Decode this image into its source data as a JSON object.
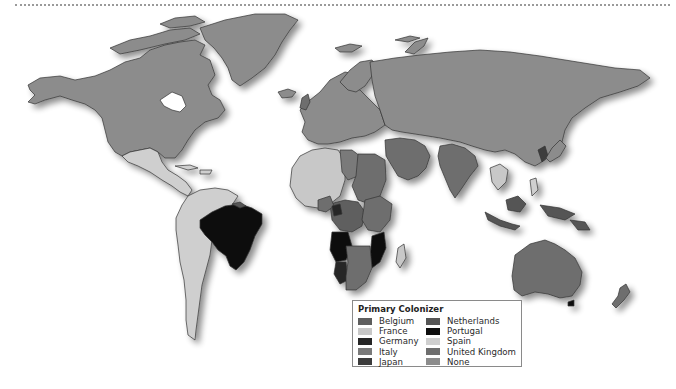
{
  "map": {
    "title": "World map of primary colonizers",
    "ocean_color": "#ffffff",
    "border_color": "#3a3a3a"
  },
  "legend": {
    "title": "Primary Colonizer",
    "items": [
      {
        "label": "Belgium",
        "color": "#5e5e5e"
      },
      {
        "label": "France",
        "color": "#c8c8c8"
      },
      {
        "label": "Germany",
        "color": "#262626"
      },
      {
        "label": "Italy",
        "color": "#7a7a7a"
      },
      {
        "label": "Japan",
        "color": "#3c3c3c"
      },
      {
        "label": "Netherlands",
        "color": "#555555"
      },
      {
        "label": "Portugal",
        "color": "#0e0e0e"
      },
      {
        "label": "Spain",
        "color": "#cfcfcf"
      },
      {
        "label": "United Kingdom",
        "color": "#6e6e6e"
      },
      {
        "label": "None",
        "color": "#8c8c8c"
      }
    ]
  },
  "regions": {
    "north_america": "None",
    "greenland": "None",
    "central_america_mexico": "Spain",
    "brazil": "Portugal",
    "south_america_rest": "Spain",
    "west_africa": "France",
    "north_africa_libya": "Italy",
    "congo": "Belgium",
    "angola_mozambique": "Portugal",
    "southern_africa": "United Kingdom",
    "europe": "None",
    "russia_asia": "None",
    "india": "United Kingdom",
    "indonesia": "Netherlands",
    "korea": "Japan",
    "australia": "United Kingdom",
    "new_zealand": "United Kingdom",
    "madagascar": "France"
  }
}
